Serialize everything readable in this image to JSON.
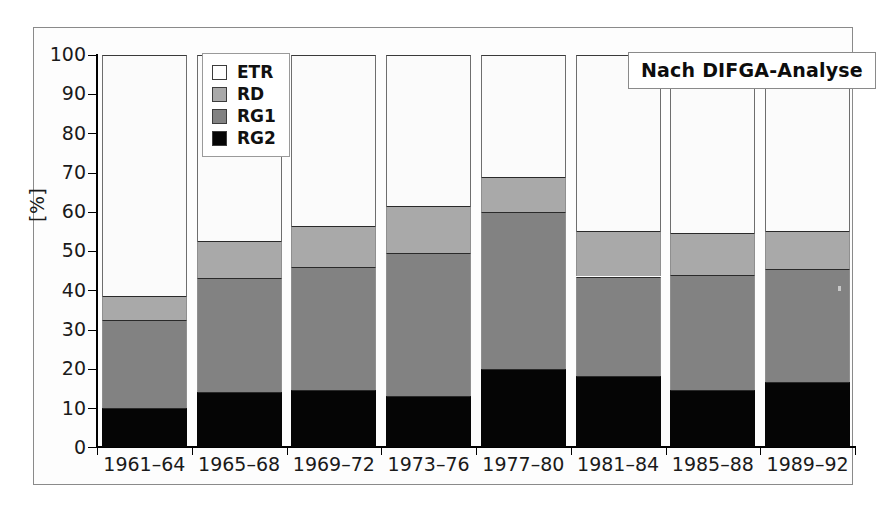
{
  "chart_data": {
    "type": "bar",
    "subtype": "stacked-bar",
    "title": "",
    "xlabel": "",
    "ylabel": "[%]",
    "ylim": [
      0,
      100
    ],
    "yticks": [
      0,
      10,
      20,
      30,
      40,
      50,
      60,
      70,
      80,
      90,
      100
    ],
    "ytick_labels": [
      "0",
      "10",
      "20",
      "30",
      "40",
      "50",
      "60",
      "70",
      "80",
      "90",
      "100"
    ],
    "grid": false,
    "stacked_total": 100,
    "categories": [
      "1961–64",
      "1965–68",
      "1969–72",
      "1973–76",
      "1977–80",
      "1981–84",
      "1985–88",
      "1989–92"
    ],
    "series": [
      {
        "name": "RG2",
        "color": "#050505",
        "values": [
          10.0,
          14.0,
          14.5,
          13.0,
          20.0,
          18.0,
          14.5,
          16.5
        ]
      },
      {
        "name": "RG1",
        "color": "#828282",
        "values": [
          22.5,
          29.0,
          31.5,
          36.5,
          40.0,
          25.5,
          29.5,
          29.0
        ]
      },
      {
        "name": "RD",
        "color": "#a9a9a9",
        "values": [
          6.0,
          9.5,
          10.5,
          12.0,
          9.0,
          11.5,
          10.5,
          9.5
        ]
      },
      {
        "name": "ETR",
        "color": "#fbfbfb",
        "values": [
          61.5,
          47.5,
          43.5,
          38.5,
          31.0,
          45.0,
          45.5,
          45.0
        ]
      }
    ],
    "cumulative_tops": {
      "RG2": [
        10.0,
        14.0,
        14.5,
        13.0,
        20.0,
        18.0,
        14.5,
        16.5
      ],
      "RG1": [
        32.5,
        43.0,
        46.0,
        49.5,
        60.0,
        43.5,
        44.0,
        45.5
      ],
      "RD": [
        38.5,
        52.5,
        56.5,
        61.5,
        69.0,
        55.0,
        54.5,
        55.0
      ],
      "ETR": [
        100,
        100,
        100,
        100,
        100,
        100,
        100,
        100
      ]
    },
    "legend": {
      "position": "upper-left-inside",
      "entries": [
        {
          "label": "ETR",
          "color": "#fbfbfb"
        },
        {
          "label": "RD",
          "color": "#a9a9a9"
        },
        {
          "label": "RG1",
          "color": "#828282"
        },
        {
          "label": "RG2",
          "color": "#050505"
        }
      ]
    },
    "annotations": [
      {
        "text": "Nach DIFGA-Analyse",
        "position": "upper-right-inside"
      }
    ]
  },
  "axes": {
    "y_title": "[%]",
    "y_labels": [
      "100",
      "90",
      "80",
      "70",
      "60",
      "50",
      "40",
      "30",
      "20",
      "10",
      "0"
    ],
    "x_labels": [
      "1961–64",
      "1965–68",
      "1969–72",
      "1973–76",
      "1977–80",
      "1981–84",
      "1985–88",
      "1989–92"
    ]
  },
  "legend": {
    "items": [
      {
        "label": "ETR",
        "swatch": "#fbfbfb"
      },
      {
        "label": "RD",
        "swatch": "#a9a9a9"
      },
      {
        "label": "RG1",
        "swatch": "#828282"
      },
      {
        "label": "RG2",
        "swatch": "#050505"
      }
    ]
  },
  "annotation": {
    "text": "Nach DIFGA-Analyse"
  },
  "colors": {
    "etr": "#fbfbfb",
    "rd": "#a9a9a9",
    "rg1": "#828282",
    "rg2": "#050505",
    "axis": "#000000",
    "frame": "#8a8a8a"
  }
}
